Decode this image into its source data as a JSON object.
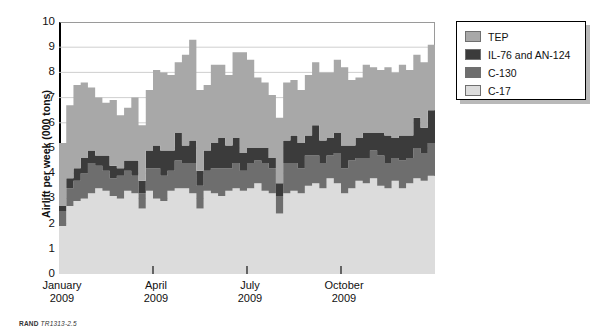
{
  "figure": {
    "footer_prefix": "RAND",
    "footer_id": "TR1313-2.5"
  },
  "legend": {
    "position": "top-right",
    "items": [
      {
        "label": "TEP",
        "color": "#a8a8a8"
      },
      {
        "label": "IL-76 and AN-124",
        "color": "#3b3b3b"
      },
      {
        "label": "C-130",
        "color": "#6e6e6e"
      },
      {
        "label": "C-17",
        "color": "#dcdcdc"
      }
    ]
  },
  "axes": {
    "ylabel": "Airlift per week (000 tons)",
    "yticks": [
      "0",
      "1",
      "2",
      "3",
      "4",
      "5",
      "6",
      "7",
      "8",
      "9",
      "10"
    ],
    "xticks": [
      {
        "month": "January",
        "year": "2009"
      },
      {
        "month": "April",
        "year": "2009"
      },
      {
        "month": "July",
        "year": "2009"
      },
      {
        "month": "October",
        "year": "2009"
      }
    ]
  },
  "chart_data": {
    "type": "area",
    "title": "",
    "xlabel": "",
    "ylabel": "Airlift per week (000 tons)",
    "ylim": [
      0,
      10
    ],
    "yticks": [
      0,
      1,
      2,
      3,
      4,
      5,
      6,
      7,
      8,
      9,
      10
    ],
    "grid": true,
    "stacked": true,
    "step": true,
    "legend_position": "top-right",
    "x_tick_labels": [
      "January 2009",
      "April 2009",
      "July 2009",
      "October 2009"
    ],
    "x_tick_indices": [
      0,
      13,
      26,
      39
    ],
    "x": [
      "W01",
      "W02",
      "W03",
      "W04",
      "W05",
      "W06",
      "W07",
      "W08",
      "W09",
      "W10",
      "W11",
      "W12",
      "W13",
      "W14",
      "W15",
      "W16",
      "W17",
      "W18",
      "W19",
      "W20",
      "W21",
      "W22",
      "W23",
      "W24",
      "W25",
      "W26",
      "W27",
      "W28",
      "W29",
      "W30",
      "W31",
      "W32",
      "W33",
      "W34",
      "W35",
      "W36",
      "W37",
      "W38",
      "W39",
      "W40",
      "W41",
      "W42",
      "W43",
      "W44",
      "W45",
      "W46",
      "W47",
      "W48",
      "W49",
      "W50",
      "W51",
      "W52"
    ],
    "series": [
      {
        "name": "C-17",
        "color": "#dcdcdc",
        "stack_order": 1,
        "values": [
          1.9,
          2.7,
          2.9,
          3.0,
          3.2,
          3.4,
          3.3,
          3.1,
          3.0,
          3.3,
          3.2,
          2.6,
          3.3,
          3.0,
          2.9,
          3.3,
          3.4,
          3.4,
          3.2,
          2.6,
          3.3,
          3.2,
          3.1,
          3.3,
          3.4,
          3.3,
          3.4,
          3.6,
          3.3,
          3.2,
          2.4,
          3.2,
          3.3,
          3.2,
          3.5,
          3.6,
          3.4,
          3.8,
          3.6,
          3.2,
          3.4,
          3.7,
          3.6,
          3.8,
          3.5,
          3.4,
          3.7,
          3.4,
          3.6,
          3.8,
          3.7,
          3.9
        ]
      },
      {
        "name": "C-130",
        "color": "#6e6e6e",
        "stack_order": 2,
        "values": [
          0.6,
          0.7,
          0.8,
          1.0,
          1.2,
          0.9,
          0.8,
          0.7,
          0.9,
          0.8,
          0.7,
          0.6,
          0.9,
          1.2,
          1.0,
          0.8,
          1.1,
          1.0,
          1.2,
          0.9,
          0.8,
          1.0,
          1.1,
          0.9,
          1.0,
          0.8,
          1.0,
          0.9,
          1.1,
          1.0,
          0.7,
          1.2,
          1.1,
          1.0,
          1.2,
          1.1,
          1.0,
          0.9,
          1.2,
          1.0,
          1.1,
          0.9,
          1.0,
          1.1,
          1.2,
          1.0,
          0.9,
          1.1,
          1.0,
          1.2,
          1.1,
          1.3
        ]
      },
      {
        "name": "IL-76 and AN-124",
        "color": "#3b3b3b",
        "stack_order": 3,
        "values": [
          0.2,
          0.4,
          0.5,
          0.6,
          0.5,
          0.4,
          0.6,
          0.5,
          0.3,
          0.4,
          0.6,
          0.5,
          0.7,
          0.9,
          1.0,
          0.8,
          1.1,
          0.7,
          0.9,
          0.6,
          0.8,
          1.0,
          1.2,
          0.9,
          1.0,
          0.7,
          0.6,
          0.5,
          0.6,
          0.4,
          0.5,
          0.9,
          1.1,
          1.0,
          0.8,
          1.2,
          0.9,
          0.7,
          0.8,
          0.9,
          0.6,
          0.8,
          1.0,
          0.7,
          0.9,
          1.1,
          0.8,
          1.0,
          0.9,
          1.2,
          1.0,
          1.3
        ]
      },
      {
        "name": "TEP",
        "color": "#a8a8a8",
        "stack_order": 4,
        "values": [
          2.5,
          2.9,
          3.3,
          3.0,
          2.5,
          2.3,
          2.1,
          2.6,
          2.1,
          2.1,
          2.5,
          2.2,
          2.4,
          3.0,
          3.1,
          3.0,
          2.8,
          3.6,
          4.0,
          3.2,
          2.6,
          3.1,
          2.9,
          2.8,
          3.4,
          4.0,
          3.5,
          2.8,
          2.6,
          2.5,
          2.6,
          2.3,
          2.2,
          2.1,
          2.4,
          2.5,
          2.7,
          2.6,
          2.9,
          3.1,
          2.6,
          2.4,
          2.7,
          2.6,
          2.5,
          2.7,
          2.6,
          2.8,
          2.6,
          2.5,
          2.6,
          2.6
        ]
      }
    ],
    "totals": [
      5.2,
      6.7,
      7.5,
      7.6,
      7.4,
      7.0,
      6.8,
      6.9,
      6.3,
      6.6,
      7.0,
      5.9,
      7.3,
      8.1,
      8.0,
      7.9,
      8.4,
      8.7,
      9.3,
      7.3,
      7.5,
      8.3,
      8.3,
      7.9,
      8.8,
      8.8,
      8.5,
      7.8,
      7.6,
      7.1,
      6.2,
      7.6,
      7.7,
      7.3,
      7.9,
      8.4,
      8.0,
      8.0,
      8.5,
      8.2,
      7.7,
      7.8,
      8.3,
      8.2,
      8.1,
      8.2,
      8.0,
      8.3,
      8.1,
      8.7,
      8.4,
      9.1
    ]
  }
}
